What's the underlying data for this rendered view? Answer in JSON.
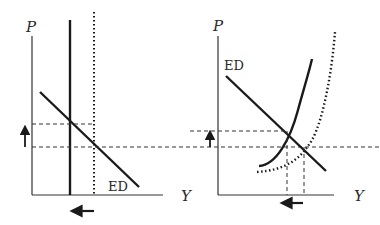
{
  "diagram": {
    "type": "economics-supply-demand",
    "colors": {
      "line": "#1a1a1a",
      "text": "#3a3a3a",
      "background": "#ffffff"
    },
    "left_panel": {
      "y_axis_label": "P",
      "x_axis_label": "Y",
      "curve_label": "ED",
      "curves": [
        "vertical supply (solid)",
        "vertical supply (dotted, shifted)",
        "ED (downward sloping)"
      ],
      "arrows": [
        "price up",
        "output left"
      ]
    },
    "right_panel": {
      "y_axis_label": "P",
      "x_axis_label": "Y",
      "curve_label": "ED",
      "curves": [
        "upward supply curve (solid)",
        "upward supply curve (dotted, shifted)",
        "ED (downward sloping)"
      ],
      "arrows": [
        "price up",
        "output left"
      ]
    }
  }
}
